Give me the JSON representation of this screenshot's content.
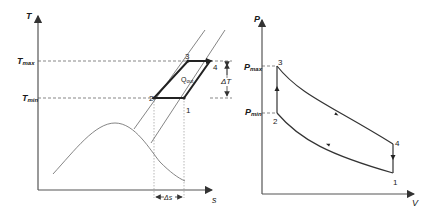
{
  "ts_diagram": {
    "y_axis_label": "T",
    "x_axis_label": "s",
    "t_max_label": "T",
    "t_max_sub": "max",
    "t_min_label": "T",
    "t_min_sub": "min",
    "q_label": "Q",
    "q_sub": "out",
    "delta_t_label": "ΔT",
    "delta_s_label": "Δs",
    "points": [
      "1",
      "2",
      "3",
      "4"
    ]
  },
  "pv_diagram": {
    "y_axis_label": "P",
    "x_axis_label": "V",
    "p_max_label": "P",
    "p_max_sub": "max",
    "p_min_label": "P",
    "p_min_sub": "min",
    "points": [
      "1",
      "2",
      "3",
      "4"
    ]
  }
}
